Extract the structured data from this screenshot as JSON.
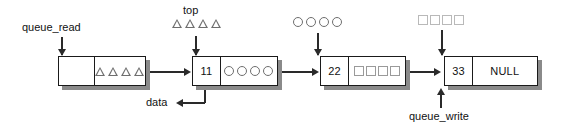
{
  "diagram": {
    "colors": {
      "box_border": "#1a1a1a",
      "box_fill": "#ffffff",
      "shadow": "#8a8a8a",
      "connector": "#2a2a2a",
      "glyph_outline": "#6e6e6e",
      "glyph_faint": "#b9b9b9",
      "text": "#111111"
    }
  },
  "nodes": [
    {
      "id": "node-1",
      "data_value": "",
      "payload_kind": "triangles",
      "payload_count": 4,
      "payload_text": "△△△△"
    },
    {
      "id": "node-2",
      "data_value": "11",
      "payload_kind": "circles",
      "payload_count": 4,
      "payload_text": "○○○○"
    },
    {
      "id": "node-3",
      "data_value": "22",
      "payload_kind": "squares",
      "payload_count": 4,
      "payload_text": "□□□□"
    },
    {
      "id": "node-4",
      "data_value": "33",
      "payload_kind": "text",
      "payload_count": 0,
      "payload_text": "NULL"
    }
  ],
  "labels": {
    "queue_read": "queue_read",
    "top": "top",
    "data": "data",
    "queue_write": "queue_write"
  },
  "floating_glyphs": [
    {
      "id": "top-triangles",
      "kind": "triangles",
      "count": 4,
      "text": "△△△△"
    },
    {
      "id": "above-node-3-circles",
      "kind": "circles",
      "count": 4,
      "text": "○○○○"
    },
    {
      "id": "above-node-4-squares",
      "kind": "squares",
      "count": 4,
      "text": "□□□□"
    }
  ]
}
